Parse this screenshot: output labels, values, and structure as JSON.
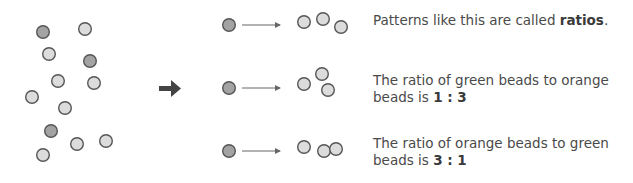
{
  "colors": {
    "green_bead_fill": "#a3a3a3",
    "orange_bead_fill": "#dcdcdc",
    "bead_stroke": "#555555",
    "arrow": "#444444",
    "thin_arrow": "#666666"
  },
  "scattered_beads": {
    "green_count": 3,
    "orange_count": 9
  },
  "groups": [
    {
      "green": 1,
      "orange": 3
    },
    {
      "green": 1,
      "orange": 3
    },
    {
      "green": 1,
      "orange": 3
    }
  ],
  "texts": {
    "t1_prefix": "Patterns like this are called ",
    "t1_bold": "ratios",
    "t1_suffix": ".",
    "t2_prefix": "The ratio of green beads to orange beads is ",
    "t2_bold": "1 : 3",
    "t3_prefix": "The ratio of orange beads to green beads is ",
    "t3_bold": "3 : 1"
  }
}
